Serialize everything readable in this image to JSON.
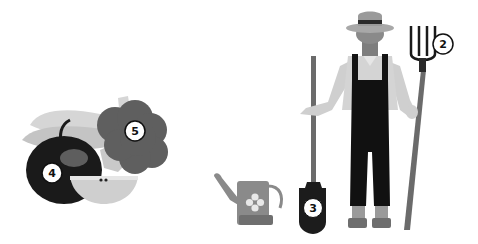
{
  "scene": {
    "description": "Grayscale illustration of a farmer with garden tools and a group of fruits/vegetables, with numbered callouts",
    "groups": [
      {
        "name": "fruit-group",
        "items": [
          "bananas",
          "apple",
          "apple-slice",
          "broccoli"
        ]
      },
      {
        "name": "garden-tools",
        "items": [
          "watering-can",
          "shovel",
          "pitchfork"
        ]
      },
      {
        "name": "farmer",
        "items": [
          "straw-hat",
          "shirt",
          "overalls",
          "boots"
        ]
      }
    ]
  },
  "labels": {
    "pitchfork": "2",
    "shovel": "3",
    "apple": "4",
    "broccoli": "5"
  },
  "colors": {
    "background": "#ffffff",
    "dark": "#1a1a1a",
    "mid": "#5e5e5e",
    "light": "#bdbdbd",
    "pale": "#dcdcdc",
    "handle": "#6b6b6b"
  }
}
